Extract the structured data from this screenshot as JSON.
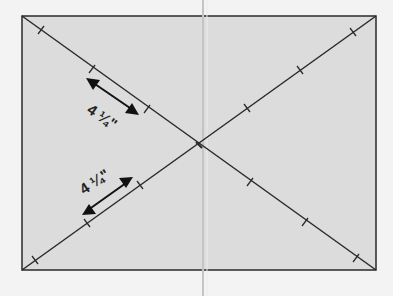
{
  "diagram": {
    "colors": {
      "background": "#f3f3f3",
      "fill": "#dcdcdc",
      "stroke": "#2a2a2a",
      "fold_line": "#c8c8c8"
    },
    "labels": {
      "upper_measure": "4 ¼\"",
      "lower_measure": "4 ¼\""
    },
    "measure_whole": "4",
    "measure_fraction": "¼",
    "measure_unit": "\""
  }
}
